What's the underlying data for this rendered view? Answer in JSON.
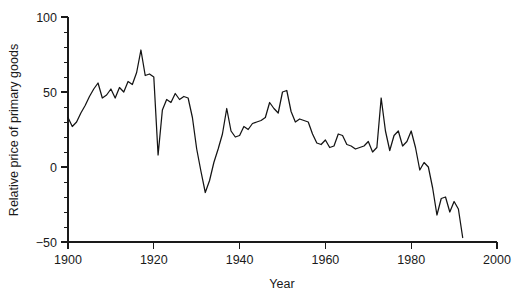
{
  "chart_data": {
    "type": "line",
    "title": "",
    "xlabel": "Year",
    "ylabel": "Relative price of primary goods",
    "xlim": [
      1900,
      2000
    ],
    "ylim": [
      -50,
      100
    ],
    "xticks": [
      1900,
      1920,
      1940,
      1960,
      1980,
      2000
    ],
    "xtick_labels": [
      "1900",
      "1920",
      "1940",
      "1960",
      "1980",
      "2000"
    ],
    "yticks": [
      -50,
      0,
      50,
      100
    ],
    "ytick_labels": [
      "-50",
      "0",
      "50",
      "100"
    ],
    "y_minor_tick_step": 10,
    "grid": false,
    "legend": null,
    "line_color": "#141414",
    "axis_color": "#1a1a1a",
    "series": [
      {
        "name": "Relative price of primary goods",
        "x": [
          1900,
          1901,
          1902,
          1903,
          1904,
          1905,
          1906,
          1907,
          1908,
          1909,
          1910,
          1911,
          1912,
          1913,
          1914,
          1915,
          1916,
          1917,
          1918,
          1919,
          1920,
          1921,
          1922,
          1923,
          1924,
          1925,
          1926,
          1927,
          1928,
          1929,
          1930,
          1931,
          1932,
          1933,
          1934,
          1935,
          1936,
          1937,
          1938,
          1939,
          1940,
          1941,
          1942,
          1943,
          1944,
          1945,
          1946,
          1947,
          1948,
          1949,
          1950,
          1951,
          1952,
          1953,
          1954,
          1955,
          1956,
          1957,
          1958,
          1959,
          1960,
          1961,
          1962,
          1963,
          1964,
          1965,
          1966,
          1967,
          1968,
          1969,
          1970,
          1971,
          1972,
          1973,
          1974,
          1975,
          1976,
          1977,
          1978,
          1979,
          1980,
          1981,
          1982,
          1983,
          1984,
          1985,
          1986,
          1987,
          1988,
          1989,
          1990,
          1991,
          1992
        ],
        "y": [
          33,
          27,
          30,
          36,
          41,
          47,
          52,
          56,
          46,
          48,
          52,
          46,
          53,
          50,
          57,
          55,
          63,
          78,
          61,
          62,
          60,
          8,
          38,
          45,
          43,
          49,
          45,
          47,
          46,
          33,
          12,
          -3,
          -17,
          -9,
          3,
          12,
          22,
          39,
          24,
          20,
          21,
          27,
          25,
          29,
          30,
          31,
          33,
          43,
          39,
          36,
          50,
          51,
          37,
          30,
          32,
          31,
          30,
          22,
          16,
          15,
          18,
          13,
          14,
          22,
          21,
          15,
          14,
          12,
          13,
          14,
          17,
          10,
          13,
          46,
          24,
          11,
          21,
          24,
          14,
          17,
          24,
          13,
          -2,
          3,
          0,
          -14,
          -32,
          -21,
          -20,
          -30,
          -23,
          -28,
          -47
        ]
      }
    ]
  },
  "geometry": {
    "plot_left": 68,
    "plot_right": 497,
    "plot_top": 17,
    "plot_bottom": 242
  }
}
